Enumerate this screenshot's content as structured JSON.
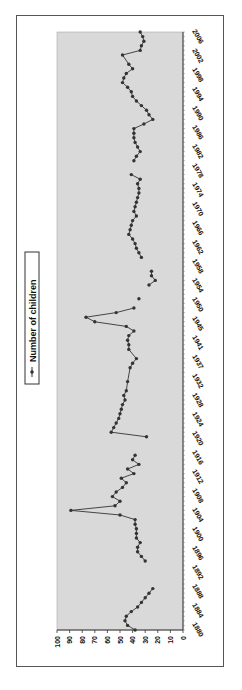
{
  "chart_data": {
    "type": "line",
    "orientation": "rotated-90-clockwise",
    "title": "",
    "xlabel": "",
    "ylabel": "",
    "ylim": [
      0,
      100
    ],
    "yticks": [
      0,
      10,
      20,
      30,
      40,
      50,
      60,
      70,
      80,
      90,
      100
    ],
    "xtick_labels": [
      "1880",
      "1884",
      "1888",
      "1892",
      "1896",
      "1900",
      "1904",
      "1908",
      "1912",
      "1916",
      "1920",
      "1924",
      "1928",
      "1932",
      "1937",
      "1941",
      "1945",
      "1950",
      "1954",
      "1958",
      "1962",
      "1966",
      "1970",
      "1974",
      "1978",
      "1982",
      "1986",
      "1990",
      "1994",
      "1998",
      "2002",
      "2006"
    ],
    "grid": false,
    "legend_position": "left (top when unrotated)",
    "plot_background": "#d9d9d9",
    "line_color": "#333333",
    "series": [
      {
        "name": "Number of children",
        "points": [
          {
            "x": 1880,
            "y": 38
          },
          {
            "x": 1881,
            "y": 44
          },
          {
            "x": 1882,
            "y": 46
          },
          {
            "x": 1883,
            "y": 45
          },
          {
            "x": 1884,
            "y": 41
          },
          {
            "x": 1885,
            "y": 36
          },
          {
            "x": 1886,
            "y": 33
          },
          {
            "x": 1887,
            "y": 30
          },
          {
            "x": 1888,
            "y": 27
          },
          {
            "x": 1889,
            "y": 24
          },
          {
            "x": null,
            "y": null
          },
          {
            "x": 1895,
            "y": 30
          },
          {
            "x": 1896,
            "y": 33
          },
          {
            "x": 1897,
            "y": 36
          },
          {
            "x": 1898,
            "y": 36
          },
          {
            "x": 1899,
            "y": 34
          },
          {
            "x": 1900,
            "y": 37
          },
          {
            "x": 1901,
            "y": 37
          },
          {
            "x": 1902,
            "y": 37
          },
          {
            "x": 1903,
            "y": 38
          },
          {
            "x": 1904,
            "y": 38
          },
          {
            "x": 1905,
            "y": 50
          },
          {
            "x": 1906,
            "y": 89
          },
          {
            "x": 1907,
            "y": 54
          },
          {
            "x": 1908,
            "y": 50
          },
          {
            "x": 1909,
            "y": 56
          },
          {
            "x": 1910,
            "y": 53
          },
          {
            "x": 1911,
            "y": 48
          },
          {
            "x": 1912,
            "y": 45
          },
          {
            "x": 1913,
            "y": 49
          },
          {
            "x": 1914,
            "y": 39
          },
          {
            "x": 1915,
            "y": 44
          },
          {
            "x": 1916,
            "y": 35
          },
          {
            "x": 1917,
            "y": 40
          },
          {
            "x": 1918,
            "y": 38
          },
          {
            "x": null,
            "y": null
          },
          {
            "x": 1922,
            "y": 29
          },
          {
            "x": 1923,
            "y": 57
          },
          {
            "x": 1924,
            "y": 55
          },
          {
            "x": 1925,
            "y": 53
          },
          {
            "x": 1926,
            "y": 51
          },
          {
            "x": 1927,
            "y": 50
          },
          {
            "x": 1928,
            "y": 49
          },
          {
            "x": 1929,
            "y": 48
          },
          {
            "x": 1930,
            "y": 46
          },
          {
            "x": 1931,
            "y": 47
          },
          {
            "x": 1932,
            "y": 45
          },
          {
            "x": 1934,
            "y": 44
          },
          {
            "x": 1937,
            "y": 42
          },
          {
            "x": 1938,
            "y": 40
          },
          {
            "x": 1939,
            "y": 37
          },
          {
            "x": 1941,
            "y": 43
          },
          {
            "x": 1942,
            "y": 43
          },
          {
            "x": 1943,
            "y": 44
          },
          {
            "x": 1944,
            "y": 43
          },
          {
            "x": 1945,
            "y": 39
          },
          {
            "x": 1946,
            "y": 45
          },
          {
            "x": 1947,
            "y": 70
          },
          {
            "x": 1948,
            "y": 77
          },
          {
            "x": 1949,
            "y": 53
          },
          {
            "x": 1950,
            "y": 39
          },
          {
            "x": null,
            "y": null
          },
          {
            "x": 1952,
            "y": 35
          },
          {
            "x": null,
            "y": null
          },
          {
            "x": 1955,
            "y": 27
          },
          {
            "x": 1956,
            "y": 22
          },
          {
            "x": 1957,
            "y": 25
          },
          {
            "x": 1958,
            "y": 25
          },
          {
            "x": null,
            "y": null
          },
          {
            "x": 1961,
            "y": 33
          },
          {
            "x": 1962,
            "y": 35
          },
          {
            "x": 1963,
            "y": 37
          },
          {
            "x": 1964,
            "y": 38
          },
          {
            "x": 1965,
            "y": 40
          },
          {
            "x": 1966,
            "y": 43
          },
          {
            "x": 1967,
            "y": 42
          },
          {
            "x": 1968,
            "y": 41
          },
          {
            "x": 1969,
            "y": 40
          },
          {
            "x": 1970,
            "y": 37
          },
          {
            "x": 1971,
            "y": 39
          },
          {
            "x": 1972,
            "y": 38
          },
          {
            "x": 1973,
            "y": 37
          },
          {
            "x": 1974,
            "y": 36
          },
          {
            "x": 1975,
            "y": 35
          },
          {
            "x": 1976,
            "y": 35
          },
          {
            "x": 1977,
            "y": 36
          },
          {
            "x": 1978,
            "y": 34
          },
          {
            "x": 1979,
            "y": 41
          },
          {
            "x": null,
            "y": null
          },
          {
            "x": 1982,
            "y": 39
          },
          {
            "x": 1983,
            "y": 37
          },
          {
            "x": 1984,
            "y": 34
          },
          {
            "x": 1985,
            "y": 36
          },
          {
            "x": 1986,
            "y": 38
          },
          {
            "x": 1987,
            "y": 39
          },
          {
            "x": 1988,
            "y": 39
          },
          {
            "x": 1989,
            "y": 39
          },
          {
            "x": 1990,
            "y": 31
          },
          {
            "x": 1991,
            "y": 24
          },
          {
            "x": 1992,
            "y": 27
          },
          {
            "x": 1993,
            "y": 29
          },
          {
            "x": 1994,
            "y": 33
          },
          {
            "x": 1995,
            "y": 37
          },
          {
            "x": 1996,
            "y": 40
          },
          {
            "x": 1997,
            "y": 41
          },
          {
            "x": 1998,
            "y": 44
          },
          {
            "x": 1999,
            "y": 48
          },
          {
            "x": 2000,
            "y": 47
          },
          {
            "x": 2001,
            "y": 45
          },
          {
            "x": 2002,
            "y": 40
          },
          {
            "x": 2003,
            "y": 43
          },
          {
            "x": 2005,
            "y": 48
          },
          {
            "x": 2006,
            "y": 34
          },
          {
            "x": 2007,
            "y": 33
          },
          {
            "x": 2008,
            "y": 31
          },
          {
            "x": 2009,
            "y": 32
          },
          {
            "x": 2010,
            "y": 34
          }
        ]
      }
    ]
  },
  "legend": {
    "label": "Number of children"
  },
  "axis": {
    "y_tick_labels": [
      "0",
      "10",
      "20",
      "30",
      "40",
      "50",
      "60",
      "70",
      "80",
      "90",
      "100"
    ]
  }
}
